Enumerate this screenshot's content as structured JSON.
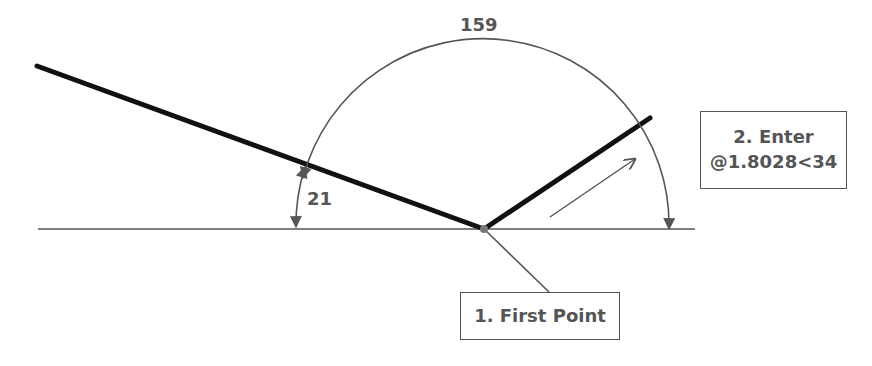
{
  "diagram": {
    "type": "polar-coordinate-angle-illustration",
    "angles": {
      "large_arc": "159",
      "small_arc": "21"
    },
    "callouts": {
      "first_point": "1. First Point",
      "enter_line1": "2. Enter",
      "enter_line2": "@1.8028<34"
    },
    "colors": {
      "thick_line": "#111111",
      "thin_line": "#555555",
      "text": "#555555",
      "background": "#ffffff"
    }
  }
}
